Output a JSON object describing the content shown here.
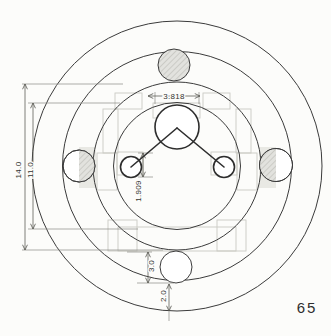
{
  "page": {
    "number": "65"
  },
  "drawing": {
    "type": "engineering-top-view-with-concentric-rings-and-molecule-layout",
    "dims": {
      "width_top": "3.818",
      "half_width": "1.909",
      "diameter_outer_ring": "14.0",
      "diameter_inner_ring": "11.0",
      "bottom_circle": "3.0",
      "outer_ring_gap": "2.0"
    },
    "colors": {
      "background": "#fcfcfa",
      "ring_line": "#3b3b3b",
      "molecule_line": "#2e2e2e",
      "dimension_line": "#55554f",
      "extension_line": "#8a8a84",
      "faint_block_outline": "#cbcbc4",
      "hatch_fill": "#e2e2de",
      "hatch_stroke": "#b4b4ae",
      "label_text": "#333330",
      "page_number_text": "#2e2e2e"
    }
  }
}
